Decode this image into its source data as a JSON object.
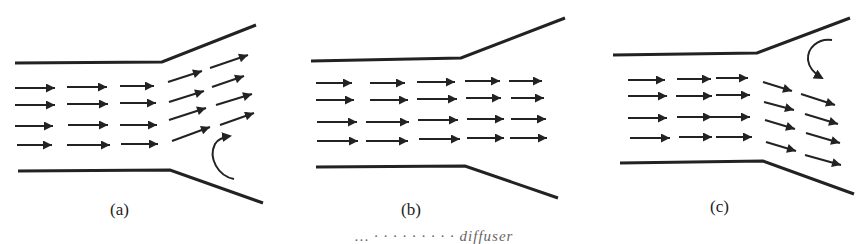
{
  "figure": {
    "panels": [
      {
        "id": "a",
        "label": "(a)",
        "description": "Diffuser flow with separation at lower wall; arrows angled upward downstream, recirculation arrow near bottom wall"
      },
      {
        "id": "b",
        "label": "(b)",
        "description": "Diffuser flow with uniform parallel arrows; no separation"
      },
      {
        "id": "c",
        "label": "(c)",
        "description": "Diffuser flow with separation at upper wall; arrows angled downward downstream, recirculation arrow near top wall"
      }
    ],
    "caption_fragment": "… ·  ·  ·  ·  ·  ·  ·  ·  · diffuser"
  },
  "colors": {
    "stroke": "#222222",
    "background": "#ffffff"
  }
}
